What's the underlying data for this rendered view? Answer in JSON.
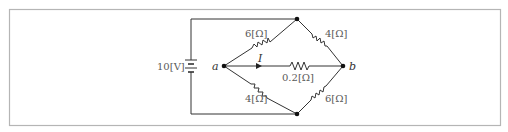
{
  "diagram": {
    "type": "wheatstone-bridge-circuit",
    "frame": {
      "stroke": "#b0b0b0"
    },
    "source": {
      "label": "10[V]",
      "voltage": 10,
      "unit": "V"
    },
    "nodes": {
      "a": {
        "label": "a"
      },
      "b": {
        "label": "b"
      }
    },
    "current": {
      "label": "I"
    },
    "resistors": [
      {
        "id": "r_top_left",
        "label": "6[Ω]",
        "value": 6
      },
      {
        "id": "r_top_right",
        "label": "4[Ω]",
        "value": 4
      },
      {
        "id": "r_bottom_left",
        "label": "4[Ω]",
        "value": 4
      },
      {
        "id": "r_bottom_right",
        "label": "6[Ω]",
        "value": 6
      },
      {
        "id": "r_middle",
        "label": "0.2[Ω]",
        "value": 0.2
      }
    ],
    "colors": {
      "wire": "#333333",
      "text": "#5a5a5a",
      "node": "#111111"
    }
  }
}
